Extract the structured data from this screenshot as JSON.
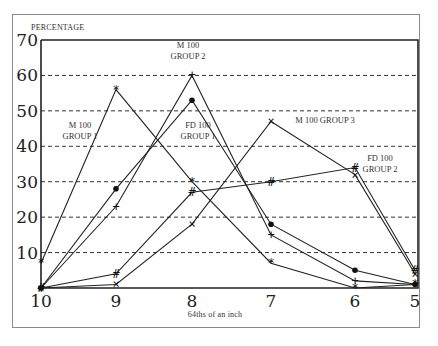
{
  "chart_data": {
    "type": "line",
    "title": "",
    "ylabel": "PERCENTAGE",
    "xlabel": "64ths of  an inch",
    "ylim": [
      0,
      70
    ],
    "yticks": [
      10,
      20,
      30,
      40,
      50,
      60,
      70
    ],
    "grid": "horizontal dashed",
    "legend": "inline annotations",
    "x": [
      10,
      9,
      8,
      7,
      6,
      5
    ],
    "series": [
      {
        "name": "M 100 GROUP 1",
        "marker": "*",
        "values": [
          7,
          56,
          30,
          7,
          0,
          1
        ]
      },
      {
        "name": "M 100 GROUP 2",
        "marker": "+",
        "values": [
          0,
          23,
          60,
          15,
          2,
          1
        ]
      },
      {
        "name": "FD 100 GROUP 1",
        "marker": "•",
        "values": [
          0,
          28,
          53,
          18,
          5,
          1
        ]
      },
      {
        "name": "M 100 GROUP 3",
        "marker": "×",
        "values": [
          0,
          1,
          18,
          47,
          32,
          4
        ]
      },
      {
        "name": "FD 100 GROUP 2",
        "marker": "#",
        "values": [
          0,
          4,
          27,
          30,
          34,
          5
        ]
      }
    ],
    "annotations": [
      {
        "lines": [
          "M 100",
          "GROUP 1"
        ],
        "x": 80,
        "y": 128
      },
      {
        "lines": [
          "M 100",
          "GROUP 2"
        ],
        "x": 188,
        "y": 48
      },
      {
        "lines": [
          "FD 100",
          "GROUP 1"
        ],
        "x": 198,
        "y": 128
      },
      {
        "lines": [
          "M 100  GROUP 3"
        ],
        "x": 325,
        "y": 123
      },
      {
        "lines": [
          "FD 100",
          "GROUP 2"
        ],
        "x": 380,
        "y": 161
      }
    ]
  }
}
